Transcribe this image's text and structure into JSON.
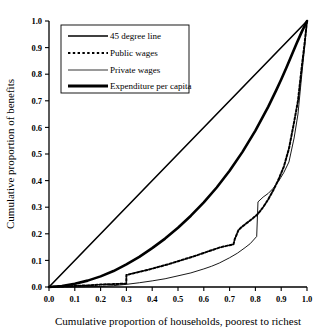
{
  "chart_data": {
    "type": "line",
    "title": "",
    "xlabel": "Cumulative proportion of households, poorest to richest",
    "ylabel": "Cumulative proportion of benefits",
    "xlim": [
      0.0,
      1.0
    ],
    "ylim": [
      0.0,
      1.0
    ],
    "grid": false,
    "legend_position": "top-left",
    "xticks": [
      "0.0",
      "0.1",
      "0.2",
      "0.3",
      "0.4",
      "0.5",
      "0.6",
      "0.7",
      "0.8",
      "0.9",
      "1.0"
    ],
    "yticks": [
      "0.0",
      "0.1",
      "0.2",
      "0.3",
      "0.4",
      "0.5",
      "0.6",
      "0.7",
      "0.8",
      "0.9",
      "1.0"
    ],
    "xtick_values": [
      0.0,
      0.1,
      0.2,
      0.3,
      0.4,
      0.5,
      0.6,
      0.7,
      0.8,
      0.9,
      1.0
    ],
    "ytick_values": [
      0.0,
      0.1,
      0.2,
      0.3,
      0.4,
      0.5,
      0.6,
      0.7,
      0.8,
      0.9,
      1.0
    ],
    "series": [
      {
        "name": "45 degree line",
        "style": "solid",
        "width": 1.6,
        "color": "#000000",
        "x": [
          0.0,
          1.0
        ],
        "y": [
          0.0,
          1.0
        ]
      },
      {
        "name": "Public wages",
        "style": "dotted",
        "width": 2.0,
        "color": "#000000",
        "x": [
          0.0,
          0.05,
          0.1,
          0.15,
          0.2,
          0.22,
          0.25,
          0.28,
          0.2995,
          0.3,
          0.32,
          0.35,
          0.38,
          0.4,
          0.43,
          0.46,
          0.5,
          0.53,
          0.56,
          0.6,
          0.63,
          0.66,
          0.68,
          0.7,
          0.715,
          0.72,
          0.735,
          0.75,
          0.77,
          0.79,
          0.81,
          0.83,
          0.85,
          0.87,
          0.89,
          0.91,
          0.93,
          0.95,
          0.965,
          0.98,
          0.99,
          1.0
        ],
        "y": [
          0.0,
          0.002,
          0.004,
          0.006,
          0.009,
          0.01,
          0.011,
          0.012,
          0.013,
          0.045,
          0.05,
          0.057,
          0.064,
          0.069,
          0.077,
          0.085,
          0.097,
          0.106,
          0.115,
          0.128,
          0.138,
          0.148,
          0.153,
          0.157,
          0.16,
          0.18,
          0.215,
          0.228,
          0.243,
          0.258,
          0.275,
          0.3,
          0.33,
          0.365,
          0.405,
          0.452,
          0.52,
          0.62,
          0.7,
          0.83,
          0.91,
          1.0
        ]
      },
      {
        "name": "Private wages",
        "style": "solid",
        "width": 0.9,
        "color": "#000000",
        "x": [
          0.0,
          0.1,
          0.2,
          0.25,
          0.3,
          0.35,
          0.4,
          0.45,
          0.5,
          0.55,
          0.6,
          0.63,
          0.66,
          0.7,
          0.73,
          0.76,
          0.78,
          0.805,
          0.81,
          0.83,
          0.85,
          0.87,
          0.89,
          0.91,
          0.93,
          0.95,
          0.965,
          0.98,
          0.99,
          1.0
        ],
        "y": [
          0.0,
          0.0,
          0.002,
          0.005,
          0.01,
          0.016,
          0.023,
          0.031,
          0.042,
          0.053,
          0.068,
          0.078,
          0.09,
          0.11,
          0.127,
          0.148,
          0.163,
          0.19,
          0.32,
          0.338,
          0.352,
          0.372,
          0.398,
          0.43,
          0.47,
          0.56,
          0.65,
          0.8,
          0.895,
          1.0
        ]
      },
      {
        "name": "Expenditure per capita",
        "style": "solid",
        "width": 2.6,
        "color": "#000000",
        "x": [
          0.0,
          0.05,
          0.1,
          0.15,
          0.2,
          0.25,
          0.3,
          0.35,
          0.4,
          0.45,
          0.5,
          0.55,
          0.6,
          0.65,
          0.7,
          0.75,
          0.8,
          0.85,
          0.88,
          0.9,
          0.92,
          0.94,
          0.96,
          0.98,
          1.0
        ],
        "y": [
          0.0,
          0.004,
          0.012,
          0.024,
          0.04,
          0.06,
          0.085,
          0.113,
          0.146,
          0.182,
          0.223,
          0.268,
          0.318,
          0.374,
          0.437,
          0.508,
          0.588,
          0.678,
          0.738,
          0.78,
          0.824,
          0.87,
          0.916,
          0.96,
          1.0
        ]
      }
    ]
  },
  "legend": {
    "items": [
      {
        "label": "45 degree line",
        "style": "solid-medium"
      },
      {
        "label": "Public wages",
        "style": "dotted"
      },
      {
        "label": "Private wages",
        "style": "solid-thin"
      },
      {
        "label": "Expenditure per capita",
        "style": "solid-thick"
      }
    ]
  }
}
